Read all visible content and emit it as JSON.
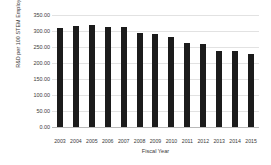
{
  "chart_data": {
    "type": "bar",
    "title": "",
    "xlabel": "Fiscal Year",
    "ylabel": "R&D per 100 STEM Employees - HHS",
    "categories": [
      "2003",
      "2004",
      "2005",
      "2006",
      "2007",
      "2008",
      "2009",
      "2010",
      "2011",
      "2012",
      "2013",
      "2014",
      "2015"
    ],
    "values": [
      308,
      316,
      319,
      313,
      311,
      293,
      290,
      280,
      264,
      258,
      238,
      238,
      228
    ],
    "ylim": [
      0,
      350
    ],
    "y_ticks": [
      350,
      300,
      250,
      200,
      150,
      100,
      50,
      0
    ],
    "y_tick_labels": [
      "350.00",
      "300.00",
      "250.00",
      "200.00",
      "150.00",
      "100.00",
      "50.00",
      "0.00"
    ],
    "grid": true,
    "legend": "none",
    "bar_color": "#1b1b1b",
    "gridline_color": "#e2e2e2",
    "series": [
      {
        "name": "R&D per 100 STEM Employees - HHS",
        "values": [
          308,
          316,
          319,
          313,
          311,
          293,
          290,
          280,
          264,
          258,
          238,
          238,
          228
        ]
      }
    ]
  },
  "axes": {
    "y_title": "R&D per 100 STEM Employees - HHS",
    "x_title": "Fiscal Year"
  }
}
